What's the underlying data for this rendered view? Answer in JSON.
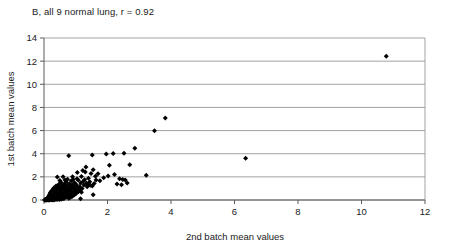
{
  "chart_data": {
    "type": "scatter",
    "title": "B, all 9 normal lung, r = 0.92",
    "xlabel": "2nd batch mean values",
    "ylabel": "1st batch mean values",
    "xlim": [
      0,
      12
    ],
    "ylim": [
      0,
      14
    ],
    "xticks": [
      0,
      2,
      4,
      6,
      8,
      10,
      12
    ],
    "yticks": [
      0,
      2,
      4,
      6,
      8,
      10,
      12,
      14
    ],
    "grid": "horizontal",
    "legend": "none",
    "correlation_r": 0.92,
    "marker": "diamond",
    "marker_color": "#000000",
    "points": [
      [
        10.78,
        12.42
      ],
      [
        3.82,
        7.08
      ],
      [
        3.48,
        5.98
      ],
      [
        2.86,
        4.48
      ],
      [
        2.52,
        4.05
      ],
      [
        2.18,
        4.02
      ],
      [
        1.96,
        3.98
      ],
      [
        1.52,
        3.88
      ],
      [
        0.78,
        3.82
      ],
      [
        6.35,
        3.6
      ],
      [
        2.7,
        3.05
      ],
      [
        2.06,
        3.0
      ],
      [
        1.32,
        2.86
      ],
      [
        1.55,
        2.62
      ],
      [
        1.22,
        2.55
      ],
      [
        1.3,
        2.42
      ],
      [
        1.05,
        2.38
      ],
      [
        1.48,
        2.3
      ],
      [
        1.7,
        2.26
      ],
      [
        2.22,
        2.2
      ],
      [
        3.22,
        2.14
      ],
      [
        2.02,
        2.08
      ],
      [
        1.62,
        2.06
      ],
      [
        1.18,
        2.04
      ],
      [
        0.9,
        2.02
      ],
      [
        0.6,
        2.0
      ],
      [
        0.42,
        1.98
      ],
      [
        1.88,
        1.92
      ],
      [
        1.4,
        1.88
      ],
      [
        2.38,
        1.84
      ],
      [
        2.48,
        1.78
      ],
      [
        2.56,
        1.72
      ],
      [
        1.08,
        1.7
      ],
      [
        0.86,
        1.66
      ],
      [
        1.24,
        1.62
      ],
      [
        1.44,
        1.58
      ],
      [
        0.7,
        1.56
      ],
      [
        0.54,
        1.52
      ],
      [
        0.96,
        1.5
      ],
      [
        1.16,
        1.46
      ],
      [
        1.34,
        1.44
      ],
      [
        1.58,
        1.42
      ],
      [
        0.8,
        1.4
      ],
      [
        0.64,
        1.38
      ],
      [
        0.46,
        1.34
      ],
      [
        1.02,
        1.32
      ],
      [
        1.26,
        1.3
      ],
      [
        1.46,
        1.28
      ],
      [
        0.88,
        1.26
      ],
      [
        0.72,
        1.24
      ],
      [
        0.56,
        1.22
      ],
      [
        0.38,
        1.2
      ],
      [
        0.98,
        1.18
      ],
      [
        1.12,
        1.16
      ],
      [
        1.36,
        1.14
      ],
      [
        0.82,
        1.12
      ],
      [
        0.66,
        1.1
      ],
      [
        0.5,
        1.08
      ],
      [
        0.32,
        1.06
      ],
      [
        0.92,
        1.04
      ],
      [
        1.06,
        1.02
      ],
      [
        1.2,
        1.0
      ],
      [
        0.76,
        0.98
      ],
      [
        0.6,
        0.96
      ],
      [
        0.44,
        0.94
      ],
      [
        0.28,
        0.92
      ],
      [
        0.86,
        0.9
      ],
      [
        1.0,
        0.88
      ],
      [
        1.14,
        0.86
      ],
      [
        0.7,
        0.84
      ],
      [
        0.54,
        0.82
      ],
      [
        0.38,
        0.8
      ],
      [
        0.24,
        0.78
      ],
      [
        0.8,
        0.76
      ],
      [
        0.94,
        0.74
      ],
      [
        1.08,
        0.72
      ],
      [
        0.64,
        0.7
      ],
      [
        0.48,
        0.68
      ],
      [
        0.34,
        0.66
      ],
      [
        0.2,
        0.64
      ],
      [
        0.74,
        0.62
      ],
      [
        0.88,
        0.6
      ],
      [
        1.02,
        0.58
      ],
      [
        0.58,
        0.56
      ],
      [
        0.44,
        0.54
      ],
      [
        0.3,
        0.52
      ],
      [
        0.18,
        0.5
      ],
      [
        0.68,
        0.48
      ],
      [
        0.82,
        0.46
      ],
      [
        0.96,
        0.45
      ],
      [
        1.55,
        0.45
      ],
      [
        0.52,
        0.43
      ],
      [
        0.4,
        0.41
      ],
      [
        0.26,
        0.39
      ],
      [
        0.16,
        0.38
      ],
      [
        0.62,
        0.36
      ],
      [
        0.76,
        0.35
      ],
      [
        0.9,
        0.33
      ],
      [
        0.46,
        0.32
      ],
      [
        0.34,
        0.3
      ],
      [
        0.22,
        0.29
      ],
      [
        0.14,
        0.27
      ],
      [
        0.56,
        0.26
      ],
      [
        0.7,
        0.25
      ],
      [
        0.84,
        0.23
      ],
      [
        0.42,
        0.22
      ],
      [
        0.3,
        0.21
      ],
      [
        0.19,
        0.19
      ],
      [
        0.11,
        0.18
      ],
      [
        0.5,
        0.17
      ],
      [
        0.64,
        0.16
      ],
      [
        0.78,
        0.15
      ],
      [
        0.38,
        0.14
      ],
      [
        0.26,
        0.13
      ],
      [
        0.16,
        0.12
      ],
      [
        0.09,
        0.11
      ],
      [
        0.46,
        0.11
      ],
      [
        0.6,
        0.1
      ],
      [
        1.15,
        0.1
      ],
      [
        0.34,
        0.09
      ],
      [
        0.23,
        0.09
      ],
      [
        0.13,
        0.08
      ],
      [
        0.07,
        0.07
      ],
      [
        0.42,
        0.07
      ],
      [
        0.54,
        0.06
      ],
      [
        0.3,
        0.06
      ],
      [
        0.2,
        0.05
      ],
      [
        0.11,
        0.05
      ],
      [
        0.05,
        0.04
      ],
      [
        0.38,
        0.04
      ],
      [
        0.48,
        0.04
      ],
      [
        0.26,
        0.03
      ],
      [
        0.17,
        0.03
      ],
      [
        0.09,
        0.02
      ],
      [
        0.04,
        0.02
      ],
      [
        0.33,
        0.02
      ],
      [
        0.22,
        0.02
      ],
      [
        0.14,
        0.01
      ],
      [
        0.07,
        0.01
      ],
      [
        0.03,
        0.01
      ],
      [
        0.28,
        0.01
      ],
      [
        0.18,
        0.01
      ],
      [
        0.1,
        0.0
      ],
      [
        0.05,
        0.0
      ],
      [
        0.02,
        0.0
      ],
      [
        0.92,
        1.78
      ],
      [
        1.04,
        1.84
      ],
      [
        0.74,
        1.8
      ],
      [
        1.64,
        1.72
      ],
      [
        1.76,
        1.66
      ],
      [
        1.28,
        1.76
      ],
      [
        0.66,
        1.72
      ],
      [
        0.5,
        1.68
      ],
      [
        1.38,
        1.34
      ],
      [
        1.52,
        1.2
      ],
      [
        0.92,
        1.36
      ],
      [
        0.58,
        1.16
      ],
      [
        0.4,
        1.12
      ],
      [
        1.18,
        0.66
      ],
      [
        0.96,
        0.52
      ],
      [
        0.72,
        0.42
      ],
      [
        2.3,
        1.38
      ],
      [
        2.44,
        1.32
      ],
      [
        2.62,
        1.46
      ]
    ]
  }
}
